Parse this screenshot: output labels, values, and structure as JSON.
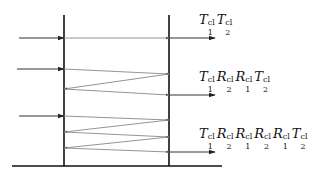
{
  "diagram": {
    "type": "multiple-reflection-ray-diagram",
    "colors": {
      "interface": "#111111",
      "ray": "#888888",
      "incident": "#333333",
      "arrowhead": "#222222"
    },
    "interfaces": [
      {
        "name": "interface-1",
        "x": 64,
        "y_top": 15,
        "y_bottom": 166
      },
      {
        "name": "interface-2",
        "x": 169,
        "y_top": 15,
        "y_bottom": 166
      }
    ],
    "ground_line": {
      "x1": 12,
      "x2": 222,
      "y": 166
    },
    "rays": [
      {
        "incident": {
          "x1": 19,
          "y1": 38,
          "x2": 64,
          "y2": 38
        },
        "path": [
          [
            64,
            38
          ],
          [
            169,
            38
          ]
        ],
        "exit": {
          "x1": 169,
          "y1": 38,
          "x2": 215,
          "y2": 38
        },
        "label": {
          "x": 199,
          "y": 13,
          "terms": [
            {
              "sym": "T",
              "sup": "cl",
              "sub": "1"
            },
            {
              "sym": "T",
              "sup": "cl",
              "sub": "2"
            }
          ]
        }
      },
      {
        "incident": {
          "x1": 17,
          "y1": 69,
          "x2": 64,
          "y2": 69
        },
        "path": [
          [
            64,
            69
          ],
          [
            169,
            74
          ],
          [
            64,
            89
          ],
          [
            169,
            95
          ]
        ],
        "exit": {
          "x1": 169,
          "y1": 95,
          "x2": 215,
          "y2": 95
        },
        "label": {
          "x": 199,
          "y": 70,
          "terms": [
            {
              "sym": "T",
              "sup": "cl",
              "sub": "1"
            },
            {
              "sym": "R",
              "sup": "cl",
              "sub": "2"
            },
            {
              "sym": "R",
              "sup": "cl",
              "sub": "1"
            },
            {
              "sym": "T",
              "sup": "cl",
              "sub": "2"
            }
          ]
        }
      },
      {
        "incident": {
          "x1": 19,
          "y1": 116,
          "x2": 64,
          "y2": 116
        },
        "path": [
          [
            64,
            116
          ],
          [
            169,
            120
          ],
          [
            64,
            132
          ],
          [
            169,
            137
          ],
          [
            64,
            148
          ],
          [
            169,
            152
          ]
        ],
        "exit": {
          "x1": 169,
          "y1": 152,
          "x2": 215,
          "y2": 152
        },
        "label": {
          "x": 199,
          "y": 127,
          "terms": [
            {
              "sym": "T",
              "sup": "cl",
              "sub": "1"
            },
            {
              "sym": "R",
              "sup": "cl",
              "sub": "2"
            },
            {
              "sym": "R",
              "sup": "cl",
              "sub": "1"
            },
            {
              "sym": "R",
              "sup": "cl",
              "sub": "2"
            },
            {
              "sym": "R",
              "sup": "cl",
              "sub": "1"
            },
            {
              "sym": "T",
              "sup": "cl",
              "sub": "2"
            }
          ]
        }
      }
    ],
    "labels_text": [
      "T1^cl T2^cl",
      "T1^cl R2^cl R1^cl T2^cl",
      "T1^cl R2^cl R1^cl R2^cl R1^cl T2^cl"
    ]
  }
}
